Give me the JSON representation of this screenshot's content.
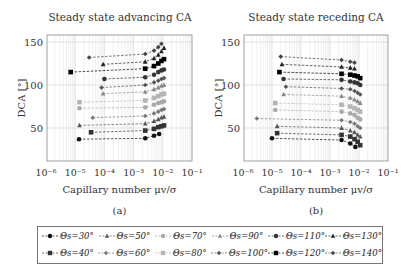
{
  "chart_data": [
    {
      "type": "scatter",
      "title": "Steady state advancing CA",
      "xlabel": "Capillary number μv/σ",
      "ylabel": "DCA [°]",
      "xscale": "log",
      "xlim": [
        1e-06,
        0.1
      ],
      "ylim": [
        12,
        158
      ],
      "xticks": [
        "10⁻⁶",
        "10⁻⁵",
        "10⁻⁴",
        "10⁻³",
        "10⁻²",
        "10⁻¹"
      ],
      "yticks": [
        50,
        100,
        150
      ],
      "grid": true,
      "caption": "(a)",
      "series": [
        {
          "name": "Θs=30°",
          "x": [
            1.35e-05,
            0.0025,
            0.005,
            0.0075
          ],
          "y": [
            37,
            38,
            41,
            43
          ]
        },
        {
          "name": "Θs=40°",
          "x": [
            3.5e-05,
            0.0025,
            0.005,
            0.007,
            0.009,
            0.011
          ],
          "y": [
            45,
            47,
            49,
            51,
            52,
            53
          ]
        },
        {
          "name": "Θs=50°",
          "x": [
            1.4e-05,
            0.0025,
            0.005,
            0.007,
            0.009,
            0.011
          ],
          "y": [
            53,
            55,
            58,
            60,
            62,
            63
          ]
        },
        {
          "name": "Θs=60°",
          "x": [
            4e-05,
            0.0025,
            0.005,
            0.007,
            0.009,
            0.011
          ],
          "y": [
            62,
            64,
            67,
            69,
            71,
            72
          ]
        },
        {
          "name": "Θs=70°",
          "x": [
            1.4e-05,
            0.0025,
            0.005,
            0.007,
            0.009,
            0.011
          ],
          "y": [
            73,
            74,
            77,
            79,
            80,
            81
          ]
        },
        {
          "name": "Θs=80°",
          "x": [
            1.4e-05,
            0.0025,
            0.005,
            0.007,
            0.009,
            0.011
          ],
          "y": [
            80,
            82,
            85,
            87,
            89,
            90
          ]
        },
        {
          "name": "Θs=90°",
          "x": [
            9e-05,
            0.0025,
            0.005,
            0.007,
            0.009,
            0.011
          ],
          "y": [
            90,
            92,
            95,
            97,
            99,
            100
          ]
        },
        {
          "name": "Θs=100°",
          "x": [
            8e-05,
            0.0025,
            0.005,
            0.007,
            0.009,
            0.011
          ],
          "y": [
            97,
            100,
            103,
            105,
            107,
            108
          ]
        },
        {
          "name": "Θs=110°",
          "x": [
            0.0001,
            0.0025,
            0.005,
            0.007,
            0.009,
            0.011
          ],
          "y": [
            107,
            109,
            112,
            115,
            117,
            118
          ]
        },
        {
          "name": "Θs=120°",
          "x": [
            7e-06,
            0.0025,
            0.005,
            0.007,
            0.009,
            0.011
          ],
          "y": [
            115,
            119,
            122,
            125,
            128,
            130
          ]
        },
        {
          "name": "Θs=130°",
          "x": [
            9e-05,
            0.0025,
            0.005,
            0.007,
            0.009,
            0.011
          ],
          "y": [
            124,
            127,
            131,
            135,
            139,
            143
          ]
        },
        {
          "name": "Θs=140°",
          "x": [
            3e-05,
            0.0025,
            0.005,
            0.007,
            0.009
          ],
          "y": [
            132,
            136,
            140,
            144,
            148
          ]
        }
      ]
    },
    {
      "type": "scatter",
      "title": "Steady state receding CA",
      "xlabel": "Capillary number μv/σ",
      "ylabel": "DCA [°]",
      "xscale": "log",
      "xlim": [
        1e-06,
        0.1
      ],
      "ylim": [
        12,
        158
      ],
      "xticks": [
        "10⁻⁶",
        "10⁻⁵",
        "10⁻⁴",
        "10⁻³",
        "10⁻²",
        "10⁻¹"
      ],
      "yticks": [
        50,
        100,
        150
      ],
      "grid": true,
      "caption": "(b)",
      "series": [
        {
          "name": "Θs=30°",
          "x": [
            1e-05,
            0.0025,
            0.005,
            0.0075
          ],
          "y": [
            38,
            36,
            32,
            28
          ]
        },
        {
          "name": "Θs=40°",
          "x": [
            1.5e-05,
            0.0025,
            0.005,
            0.007,
            0.009,
            0.011
          ],
          "y": [
            44,
            42,
            40,
            37,
            34,
            30
          ]
        },
        {
          "name": "Θs=50°",
          "x": [
            1.5e-05,
            0.0025,
            0.005,
            0.007,
            0.009,
            0.011
          ],
          "y": [
            52,
            50,
            47,
            45,
            42,
            40
          ]
        },
        {
          "name": "Θs=60°",
          "x": [
            3e-06,
            0.0025,
            0.005,
            0.007,
            0.009,
            0.011
          ],
          "y": [
            61,
            59,
            57,
            55,
            52,
            50
          ]
        },
        {
          "name": "Θs=70°",
          "x": [
            1.3e-05,
            0.0025,
            0.005,
            0.007,
            0.009,
            0.011
          ],
          "y": [
            71,
            69,
            67,
            65,
            62,
            60
          ]
        },
        {
          "name": "Θs=80°",
          "x": [
            1.3e-05,
            0.0025,
            0.005,
            0.007,
            0.009,
            0.011
          ],
          "y": [
            79,
            77,
            75,
            73,
            71,
            69
          ]
        },
        {
          "name": "Θs=90°",
          "x": [
            2.5e-05,
            0.0025,
            0.005,
            0.007,
            0.009,
            0.011
          ],
          "y": [
            89,
            87,
            85,
            83,
            81,
            79
          ]
        },
        {
          "name": "Θs=100°",
          "x": [
            3e-05,
            0.0025,
            0.005,
            0.007,
            0.009,
            0.011
          ],
          "y": [
            98,
            96,
            95,
            93,
            91,
            89
          ]
        },
        {
          "name": "Θs=110°",
          "x": [
            2.5e-05,
            0.0025,
            0.005,
            0.007,
            0.009,
            0.011
          ],
          "y": [
            107,
            106,
            104,
            103,
            102,
            100
          ]
        },
        {
          "name": "Θs=120°",
          "x": [
            1.8e-05,
            0.0025,
            0.005,
            0.007,
            0.009,
            0.011
          ],
          "y": [
            115,
            113,
            112,
            111,
            110,
            108
          ]
        },
        {
          "name": "Θs=130°",
          "x": [
            2.2e-05,
            0.0025,
            0.005,
            0.007
          ],
          "y": [
            124,
            121,
            120,
            119
          ]
        },
        {
          "name": "Θs=140°",
          "x": [
            2e-05,
            0.0025,
            0.005,
            0.007
          ],
          "y": [
            133,
            129,
            127,
            126
          ]
        }
      ]
    }
  ],
  "legend": {
    "items": [
      {
        "label": "Θs=30°",
        "marker": "circle",
        "color": "#111111"
      },
      {
        "label": "Θs=50°",
        "marker": "triangle",
        "color": "#555555"
      },
      {
        "label": "Θs=70°",
        "marker": "circle",
        "color": "#aaaaaa"
      },
      {
        "label": "Θs=90°",
        "marker": "triangle",
        "color": "#888888"
      },
      {
        "label": "Θs=110°",
        "marker": "circle",
        "color": "#333333"
      },
      {
        "label": "Θs=130°",
        "marker": "triangle",
        "color": "#222222"
      },
      {
        "label": "Θs=40°",
        "marker": "square",
        "color": "#333333"
      },
      {
        "label": "Θs=60°",
        "marker": "diamond",
        "color": "#777777"
      },
      {
        "label": "Θs=80°",
        "marker": "square",
        "color": "#b5b5b5"
      },
      {
        "label": "Θs=100°",
        "marker": "diamond",
        "color": "#555555"
      },
      {
        "label": "Θs=120°",
        "marker": "square",
        "color": "#000000"
      },
      {
        "label": "Θs=140°",
        "marker": "diamond",
        "color": "#444444"
      }
    ]
  }
}
